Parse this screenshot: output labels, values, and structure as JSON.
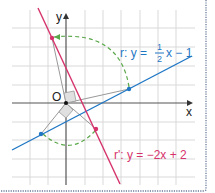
{
  "figure": {
    "axes": {
      "x_label": "x",
      "y_label": "y",
      "origin_label": "O"
    },
    "line_r": {
      "label_prefix": "r: y = ",
      "num": "1",
      "den": "2",
      "suffix": "x − 1",
      "color": "#1f77c4"
    },
    "line_r_prime": {
      "label": "r': y = −2x + 2",
      "color": "#d6336c"
    },
    "arc_color": "#5aa84a",
    "grid_color": "#d9d9d9",
    "frame_color": "#6a7a9a"
  }
}
